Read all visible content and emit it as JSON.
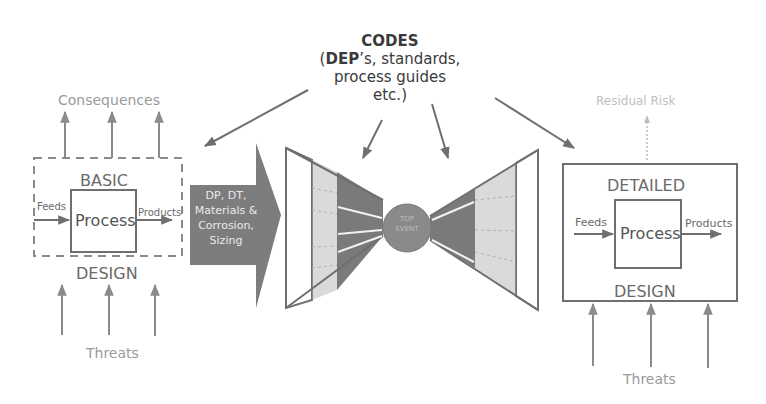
{
  "codes": {
    "title": "CODES",
    "line1_bold": "DEP",
    "line1_rest": "’s, standards,",
    "line2": "process guides",
    "line3": "etc.)",
    "line1_open": "("
  },
  "basic_design": {
    "top_label": "BASIC",
    "bottom_label": "DESIGN",
    "process_label": "Process",
    "feeds_label": "Feeds",
    "products_label": "Products",
    "consequences_label": "Consequences",
    "threats_label": "Threats"
  },
  "arrow_box": {
    "lines": [
      "DP, DT,",
      "Materials &",
      "Corrosion,",
      "Sizing"
    ]
  },
  "bowtie": {
    "center_line1": "TOP",
    "center_line2": "EVENT"
  },
  "detailed_design": {
    "top_label": "DETAILED",
    "bottom_label": "DESIGN",
    "process_label": "Process",
    "feeds_label": "Feeds",
    "products_label": "Products",
    "residual_label": "Residual Risk",
    "threats_label": "Threats"
  },
  "colors": {
    "line": "#6f6f6f",
    "light_text": "#a5a5a5",
    "dark_fill": "#777777",
    "light_fill": "#d8d8d8"
  }
}
